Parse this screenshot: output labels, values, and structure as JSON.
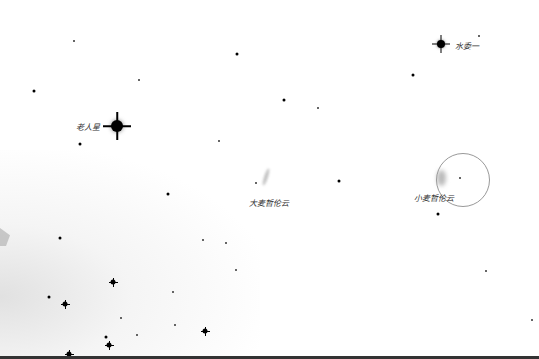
{
  "map": {
    "type": "star-chart",
    "background_color": "#ffffff",
    "labels": {
      "canopus": "老人星",
      "achernar": "水委一",
      "lmc": "大麦哲伦云",
      "smc": "小麦哲伦云"
    },
    "named_objects": [
      {
        "id": "canopus",
        "name": "老人星",
        "x": 117,
        "y": 126,
        "size": "s5"
      },
      {
        "id": "achernar",
        "name": "水委一",
        "x": 441,
        "y": 44,
        "size": "s4"
      },
      {
        "id": "lmc",
        "name": "大麦哲伦云",
        "x": 266,
        "y": 177
      },
      {
        "id": "smc",
        "name": "小麦哲伦云",
        "x": 440,
        "y": 178
      }
    ],
    "field_of_view_circle": {
      "cx": 462,
      "cy": 179,
      "r": 26,
      "color": "#999999"
    },
    "stars": [
      {
        "x": 74,
        "y": 41,
        "size": "s1"
      },
      {
        "x": 237,
        "y": 54,
        "size": "s2"
      },
      {
        "x": 34,
        "y": 91,
        "size": "s2"
      },
      {
        "x": 139,
        "y": 80,
        "size": "s1"
      },
      {
        "x": 80,
        "y": 144,
        "size": "s2"
      },
      {
        "x": 219,
        "y": 141,
        "size": "s1"
      },
      {
        "x": 284,
        "y": 100,
        "size": "s2"
      },
      {
        "x": 318,
        "y": 108,
        "size": "s1"
      },
      {
        "x": 413,
        "y": 75,
        "size": "s2"
      },
      {
        "x": 479,
        "y": 36,
        "size": "s1"
      },
      {
        "x": 168,
        "y": 194,
        "size": "s2"
      },
      {
        "x": 339,
        "y": 181,
        "size": "s2"
      },
      {
        "x": 460,
        "y": 178,
        "size": "s1"
      },
      {
        "x": 438,
        "y": 214,
        "size": "s2"
      },
      {
        "x": 60,
        "y": 238,
        "size": "s2"
      },
      {
        "x": 203,
        "y": 240,
        "size": "s1"
      },
      {
        "x": 226,
        "y": 243,
        "size": "s1"
      },
      {
        "x": 236,
        "y": 270,
        "size": "s1"
      },
      {
        "x": 113,
        "y": 282,
        "size": "s3"
      },
      {
        "x": 173,
        "y": 292,
        "size": "s1"
      },
      {
        "x": 486,
        "y": 271,
        "size": "s1"
      },
      {
        "x": 49,
        "y": 297,
        "size": "s2"
      },
      {
        "x": 65,
        "y": 304,
        "size": "s3"
      },
      {
        "x": 121,
        "y": 318,
        "size": "s1"
      },
      {
        "x": 175,
        "y": 325,
        "size": "s1"
      },
      {
        "x": 205,
        "y": 331,
        "size": "s3"
      },
      {
        "x": 137,
        "y": 335,
        "size": "s1"
      },
      {
        "x": 106,
        "y": 337,
        "size": "s2"
      },
      {
        "x": 109,
        "y": 345,
        "size": "s3"
      },
      {
        "x": 69,
        "y": 354,
        "size": "s3"
      },
      {
        "x": 532,
        "y": 320,
        "size": "s1"
      }
    ]
  }
}
